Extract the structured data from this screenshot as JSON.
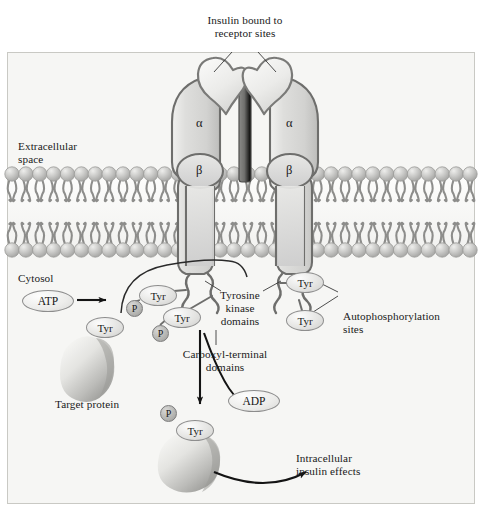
{
  "diagram": {
    "title_note": "Insulin receptor signaling pathway",
    "background": "#f6f6f4",
    "frame_border": "#c9c9c4"
  },
  "labels": {
    "insulin_bound": "Insulin bound to\nreceptor sites",
    "extracellular": "Extracellular\nspace",
    "cytosol": "Cytosol",
    "tyrosine_kinase": "Tyrosine\nkinase\ndomains",
    "carboxyl_terminal": "Carboxyl-terminal\ndomains",
    "autophosphorylation": "Autophosphorylation\nsites",
    "target_protein": "Target protein",
    "intracellular_effects": "Intracellular\ninsulin effects"
  },
  "subunits": {
    "alpha_left": "α",
    "alpha_right": "α",
    "beta_left": "β",
    "beta_right": "β"
  },
  "molecules": {
    "atp": "ATP",
    "adp": "ADP",
    "tyr": "Tyr",
    "phosphate": "P"
  },
  "residues": {
    "receptor_left": [
      {
        "label": "Tyr",
        "x": 139,
        "y": 285
      },
      {
        "label": "Tyr",
        "x": 163,
        "y": 307
      },
      {
        "label": "Tyr",
        "x": 86,
        "y": 317
      }
    ],
    "receptor_right": [
      {
        "label": "Tyr",
        "x": 286,
        "y": 272
      },
      {
        "label": "Tyr",
        "x": 286,
        "y": 310
      }
    ],
    "target": [
      {
        "label": "Tyr",
        "x": 176,
        "y": 420
      }
    ],
    "phosphates": [
      {
        "label": "P",
        "x": 126,
        "y": 300
      },
      {
        "label": "P",
        "x": 152,
        "y": 325
      },
      {
        "label": "P",
        "x": 160,
        "y": 405
      }
    ]
  },
  "membrane": {
    "head_count": 34,
    "head_color": "#c8c8c6",
    "tail_color": "#8d8d8b"
  },
  "colors": {
    "receptor_fill": "#dcdcda",
    "receptor_stroke": "#6e6e6c",
    "insulin_fill": "#efefed",
    "arrow": "#1a1a1a",
    "leader": "#3a3a3a"
  }
}
